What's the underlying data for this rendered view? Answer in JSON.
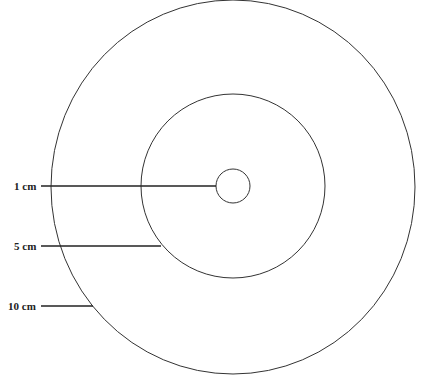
{
  "diagram": {
    "type": "concentric-circles",
    "stroke_color": "#333333",
    "center": [
      233,
      186
    ],
    "circles": [
      {
        "label": "1 cm",
        "r": 17,
        "label_y": 186,
        "line_end_x": 216
      },
      {
        "label": "5 cm",
        "r": 92,
        "label_y": 246,
        "line_end_x": 162
      },
      {
        "label": "10 cm",
        "rx": 182,
        "ry": 186,
        "label_y": 306,
        "line_end_x": 92
      }
    ]
  },
  "labels": {
    "one": "1 cm",
    "five": "5 cm",
    "ten": "10 cm"
  }
}
